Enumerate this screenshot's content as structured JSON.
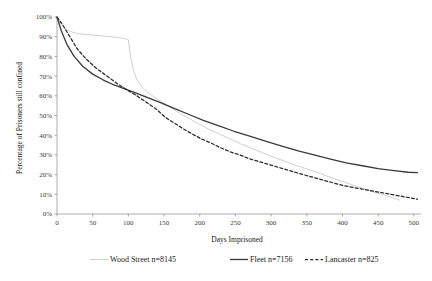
{
  "chart_data": {
    "type": "line",
    "title": "",
    "subtitle": "",
    "xlabel": "Days Imprisoned",
    "ylabel": "Percentage of Prisoners still confined",
    "xlim": [
      0,
      510
    ],
    "ylim": [
      0,
      100
    ],
    "xticks": [
      0,
      50,
      100,
      150,
      200,
      250,
      300,
      350,
      400,
      450,
      500
    ],
    "xtick_labels": [
      "0",
      "50",
      "100",
      "150",
      "200",
      "250",
      "300",
      "350",
      "400",
      "450",
      "500"
    ],
    "yticks": [
      0,
      10,
      20,
      30,
      40,
      50,
      60,
      70,
      80,
      90,
      100
    ],
    "ytick_labels": [
      "0%",
      "10%",
      "20%",
      "30%",
      "40%",
      "50%",
      "60%",
      "70%",
      "80%",
      "90%",
      "100%"
    ],
    "grid": false,
    "legend_position": "bottom",
    "series": [
      {
        "name": "Wood Street n=8145",
        "style": "solid-light",
        "color": "#d0d0d0",
        "x": [
          0,
          5,
          12,
          20,
          30,
          45,
          60,
          75,
          88,
          95,
          100,
          103,
          107,
          112,
          120,
          130,
          142,
          155,
          168,
          180,
          195,
          210,
          225,
          240,
          258,
          275,
          292,
          310,
          328,
          345,
          362,
          380,
          400,
          420,
          440,
          460,
          480
        ],
        "y": [
          100,
          97,
          94,
          92.5,
          91.5,
          91,
          90.5,
          90,
          89.5,
          89,
          88.5,
          80,
          73,
          68,
          64,
          61,
          58,
          55,
          52,
          49.5,
          46.5,
          43.5,
          41,
          38.5,
          35.5,
          33,
          30.5,
          28,
          25.5,
          23.5,
          21.5,
          19,
          16.5,
          14,
          11.5,
          9.5,
          7
        ]
      },
      {
        "name": "Fleet n=7156",
        "style": "solid",
        "color": "#3a3a3a",
        "x": [
          0,
          6,
          14,
          24,
          36,
          50,
          65,
          80,
          95,
          110,
          128,
          145,
          165,
          185,
          205,
          225,
          248,
          270,
          292,
          315,
          338,
          360,
          382,
          405,
          428,
          450,
          472,
          492,
          505
        ],
        "y": [
          100,
          93,
          86,
          80,
          75,
          71,
          68,
          65.5,
          63.5,
          61.5,
          59,
          56.5,
          53.5,
          50.5,
          47.5,
          45,
          42,
          39.5,
          37,
          34.5,
          32,
          30,
          28,
          26,
          24.5,
          23,
          22,
          21.2,
          21
        ]
      },
      {
        "name": "Lancaster n=825",
        "style": "dashed",
        "color": "#2a2a2a",
        "x": [
          0,
          8,
          18,
          28,
          40,
          55,
          70,
          85,
          98,
          112,
          126,
          140,
          152,
          165,
          178,
          190,
          203,
          216,
          230,
          243,
          256,
          270,
          284,
          298,
          312,
          326,
          340,
          355,
          370,
          385,
          400,
          415,
          430,
          445,
          460,
          475,
          490,
          505
        ],
        "y": [
          100,
          96,
          90,
          84,
          79,
          74,
          70,
          66,
          63,
          60,
          56.5,
          53,
          49,
          46,
          43,
          40.5,
          38,
          36,
          33.5,
          31.5,
          30,
          28,
          26.5,
          25,
          23.5,
          22,
          20.5,
          19,
          17.5,
          16,
          14.5,
          13.5,
          12.5,
          11.5,
          10.5,
          9.5,
          8.5,
          7.5
        ]
      }
    ]
  },
  "legend": {
    "items": [
      {
        "label": "Wood Street n=8145",
        "color": "#d0d0d0",
        "style": "solid-light"
      },
      {
        "label": "Fleet n=7156",
        "color": "#3a3a3a",
        "style": "solid"
      },
      {
        "label": "Lancaster n=825",
        "color": "#2a2a2a",
        "style": "dashed"
      }
    ]
  },
  "axes": {
    "x_title": "Days Imprisoned",
    "y_title": "Percentage of Prisoners still confined"
  }
}
